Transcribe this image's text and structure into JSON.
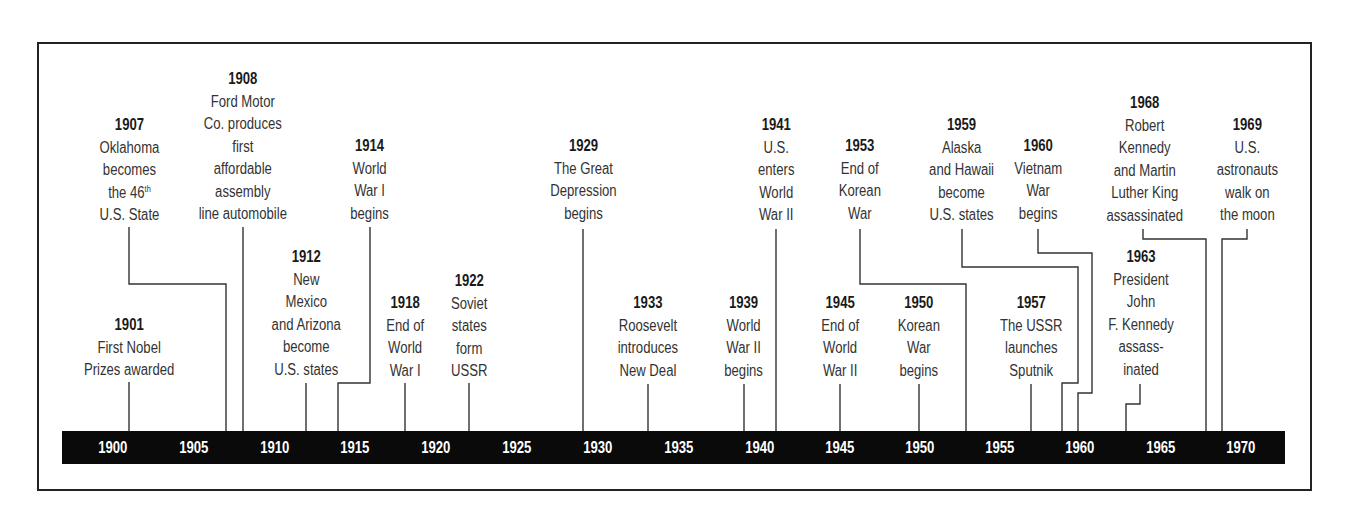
{
  "chart_data": {
    "type": "timeline",
    "title": "",
    "axis": {
      "range": [
        1900,
        1970
      ],
      "tick_step": 5,
      "ticks": [
        "1900",
        "1905",
        "1910",
        "1915",
        "1920",
        "1925",
        "1930",
        "1935",
        "1940",
        "1945",
        "1950",
        "1955",
        "1960",
        "1965",
        "1970"
      ],
      "bar_color": "#0a0a0a",
      "tick_label_color": "#ffffff"
    },
    "events": [
      {
        "year": "1901",
        "lines": [
          "First Nobel",
          "Prizes awarded"
        ]
      },
      {
        "year": "1907",
        "lines": [
          "Oklahoma",
          "becomes",
          "the 46th",
          "U.S. State"
        ]
      },
      {
        "year": "1908",
        "lines": [
          "Ford Motor",
          "Co. produces",
          "first",
          "affordable",
          "assembly",
          "line automobile"
        ]
      },
      {
        "year": "1912",
        "lines": [
          "New",
          "Mexico",
          "and Arizona",
          "become",
          "U.S. states"
        ]
      },
      {
        "year": "1914",
        "lines": [
          "World",
          "War I",
          "begins"
        ]
      },
      {
        "year": "1918",
        "lines": [
          "End of",
          "World",
          "War I"
        ]
      },
      {
        "year": "1922",
        "lines": [
          "Soviet",
          "states",
          "form",
          "USSR"
        ]
      },
      {
        "year": "1929",
        "lines": [
          "The Great",
          "Depression",
          "begins"
        ]
      },
      {
        "year": "1933",
        "lines": [
          "Roosevelt",
          "introduces",
          "New Deal"
        ]
      },
      {
        "year": "1939",
        "lines": [
          "World",
          "War II",
          "begins"
        ]
      },
      {
        "year": "1941",
        "lines": [
          "U.S.",
          "enters",
          "World",
          "War II"
        ]
      },
      {
        "year": "1945",
        "lines": [
          "End of",
          "World",
          "War II"
        ]
      },
      {
        "year": "1950",
        "lines": [
          "Korean",
          "War",
          "begins"
        ]
      },
      {
        "year": "1953",
        "lines": [
          "End of",
          "Korean",
          "War"
        ]
      },
      {
        "year": "1957",
        "lines": [
          "The USSR",
          "launches",
          "Sputnik"
        ]
      },
      {
        "year": "1959",
        "lines": [
          "Alaska",
          "and Hawaii",
          "become",
          "U.S. states"
        ]
      },
      {
        "year": "1960",
        "lines": [
          "Vietnam",
          "War",
          "begins"
        ]
      },
      {
        "year": "1963",
        "lines": [
          "President",
          "John",
          "F. Kennedy",
          "assass-",
          "inated"
        ]
      },
      {
        "year": "1968",
        "lines": [
          "Robert",
          "Kennedy",
          "and Martin",
          "Luther King",
          "assassinated"
        ]
      },
      {
        "year": "1969",
        "lines": [
          "U.S.",
          "astronauts",
          "walk on",
          "the moon"
        ]
      }
    ]
  },
  "timeline": {
    "ticks": [
      {
        "label": "1900",
        "x": 113
      },
      {
        "label": "1905",
        "x": 194
      },
      {
        "label": "1910",
        "x": 275
      },
      {
        "label": "1915",
        "x": 355
      },
      {
        "label": "1920",
        "x": 436
      },
      {
        "label": "1925",
        "x": 517
      },
      {
        "label": "1930",
        "x": 598
      },
      {
        "label": "1935",
        "x": 679
      },
      {
        "label": "1940",
        "x": 760
      },
      {
        "label": "1945",
        "x": 840
      },
      {
        "label": "1950",
        "x": 920
      },
      {
        "label": "1955",
        "x": 1000
      },
      {
        "label": "1960",
        "x": 1080
      },
      {
        "label": "1965",
        "x": 1161
      },
      {
        "label": "1970",
        "x": 1241
      }
    ],
    "events": [
      {
        "year": "1901",
        "cx": 129,
        "top": 314,
        "lines": [
          "First Nobel",
          "Prizes awarded"
        ],
        "connector": "129,382 129,432"
      },
      {
        "year": "1907",
        "cx": 129,
        "top": 114,
        "lines": [
          "Oklahoma",
          "becomes",
          "the 46",
          "U.S. State"
        ],
        "sup_line": 2,
        "sup": "th",
        "connector": "129,227 129,284 226,284 226,432"
      },
      {
        "year": "1908",
        "cx": 243,
        "top": 68,
        "lines": [
          "Ford Motor",
          "Co. produces",
          "first",
          "affordable",
          "assembly",
          "line automobile"
        ],
        "connector": "243,227 243,432"
      },
      {
        "year": "1912",
        "cx": 306,
        "top": 246,
        "lines": [
          "New",
          "Mexico",
          "and Arizona",
          "become",
          "U.S. states"
        ],
        "connector": "306,383 306,432"
      },
      {
        "year": "1914",
        "cx": 370,
        "top": 135,
        "lines": [
          "World",
          "War I",
          "begins"
        ],
        "connector": "370,227 370,383 338,383 338,432"
      },
      {
        "year": "1918",
        "cx": 405,
        "top": 292,
        "lines": [
          "End of",
          "World",
          "War I"
        ],
        "connector": "405,383 405,432"
      },
      {
        "year": "1922",
        "cx": 469,
        "top": 270,
        "lines": [
          "Soviet",
          "states",
          "form",
          "USSR"
        ],
        "connector": "469,383 469,432"
      },
      {
        "year": "1929",
        "cx": 583,
        "top": 135,
        "lines": [
          "The Great",
          "Depression",
          "begins"
        ],
        "connector": "583,229 583,432"
      },
      {
        "year": "1933",
        "cx": 648,
        "top": 292,
        "lines": [
          "Roosevelt",
          "introduces",
          "New Deal"
        ],
        "connector": "648,384 648,432"
      },
      {
        "year": "1939",
        "cx": 744,
        "top": 292,
        "lines": [
          "World",
          "War II",
          "begins"
        ],
        "connector": "744,384 744,432"
      },
      {
        "year": "1941",
        "cx": 776,
        "top": 114,
        "lines": [
          "U.S.",
          "enters",
          "World",
          "War II"
        ],
        "connector": "776,229 776,432"
      },
      {
        "year": "1945",
        "cx": 840,
        "top": 292,
        "lines": [
          "End of",
          "World",
          "War II"
        ],
        "connector": "840,384 840,432"
      },
      {
        "year": "1950",
        "cx": 919,
        "top": 292,
        "lines": [
          "Korean",
          "War",
          "begins"
        ],
        "connector": "919,384 919,432"
      },
      {
        "year": "1953",
        "cx": 860,
        "top": 135,
        "lines": [
          "End of",
          "Korean",
          "War"
        ],
        "connector": "860,229 860,284 966,284 966,432"
      },
      {
        "year": "1957",
        "cx": 1031,
        "top": 292,
        "lines": [
          "The USSR",
          "launches",
          "Sputnik"
        ],
        "connector": "1031,384 1031,432"
      },
      {
        "year": "1959",
        "cx": 962,
        "top": 114,
        "lines": [
          "Alaska",
          "and Hawaii",
          "become",
          "U.S. states"
        ],
        "connector": "962,229 962,267 1078,267 1078,383 1062,383 1062,432"
      },
      {
        "year": "1960",
        "cx": 1038,
        "top": 135,
        "lines": [
          "Vietnam",
          "War",
          "begins"
        ],
        "connector": "1038,229 1038,253 1092,253 1092,393 1078,393 1078,432"
      },
      {
        "year": "1963",
        "cx": 1141,
        "top": 246,
        "lines": [
          "President",
          "John",
          "F. Kennedy",
          "assass-",
          "inated"
        ],
        "connector": "1140,384 1140,404 1126,404 1126,432"
      },
      {
        "year": "1968",
        "cx": 1145,
        "top": 92,
        "lines": [
          "Robert",
          "Kennedy",
          "and Martin",
          "Luther King",
          "assassinated"
        ],
        "connector": "1143,229 1143,239 1206,239 1206,432"
      },
      {
        "year": "1969",
        "cx": 1247,
        "top": 114,
        "lines": [
          "U.S.",
          "astronauts",
          "walk on",
          "the moon"
        ],
        "connector": "1247,229 1247,239 1222,239 1222,432"
      }
    ]
  }
}
